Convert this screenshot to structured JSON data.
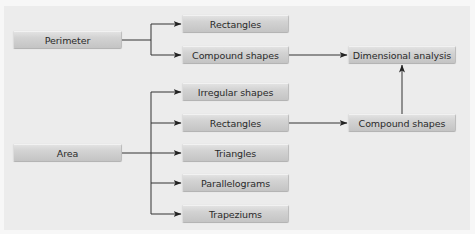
{
  "diagram": {
    "nodes": {
      "perimeter": "Perimeter",
      "area": "Area",
      "perimeter_rectangles": "Rectangles",
      "perimeter_compound": "Compound shapes",
      "irregular": "Irregular shapes",
      "area_rectangles": "Rectangles",
      "triangles": "Triangles",
      "parallelograms": "Parallelograms",
      "trapeziums": "Trapeziums",
      "dimensional_analysis": "Dimensional analysis",
      "area_compound": "Compound shapes"
    },
    "edges": [
      {
        "from": "Perimeter",
        "to": "Rectangles"
      },
      {
        "from": "Perimeter",
        "to": "Compound shapes"
      },
      {
        "from": "Compound shapes (perimeter)",
        "to": "Dimensional analysis"
      },
      {
        "from": "Area",
        "to": "Irregular shapes"
      },
      {
        "from": "Area",
        "to": "Rectangles"
      },
      {
        "from": "Area",
        "to": "Triangles"
      },
      {
        "from": "Area",
        "to": "Parallelograms"
      },
      {
        "from": "Area",
        "to": "Trapeziums"
      },
      {
        "from": "Rectangles (area)",
        "to": "Compound shapes"
      },
      {
        "from": "Compound shapes (area)",
        "to": "Dimensional analysis"
      }
    ],
    "colors": {
      "background": "#ececec",
      "box": "#cfcfcf",
      "line": "#333333",
      "text": "#2a2a2a"
    }
  }
}
